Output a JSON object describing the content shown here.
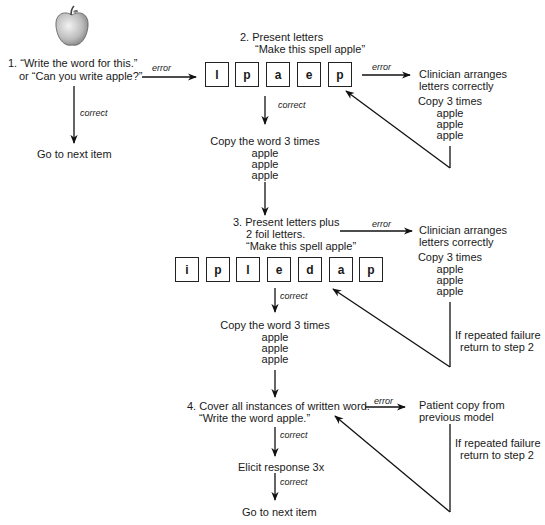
{
  "step1": {
    "line1": "1. “Write the word for this.”",
    "line2": "or “Can you write apple?”",
    "error_label": "error",
    "correct_label": "correct",
    "next": "Go to next item"
  },
  "step2": {
    "line1": "2. Present letters",
    "line2": "“Make this spell apple”",
    "letters": [
      "l",
      "p",
      "a",
      "e",
      "p"
    ],
    "error_label": "error",
    "correct_label": "correct",
    "error_action": {
      "line1": "Clinician arranges",
      "line2": "letters correctly"
    },
    "error_copy": {
      "title": "Copy 3 times",
      "words": [
        "apple",
        "apple",
        "apple"
      ]
    },
    "correct_copy": {
      "title": "Copy the word 3 times",
      "words": [
        "apple",
        "apple",
        "apple"
      ]
    }
  },
  "step3": {
    "line1": "3. Present letters plus",
    "line2": "2 foil letters.",
    "line3": "“Make this spell apple”",
    "letters": [
      "i",
      "p",
      "l",
      "e",
      "d",
      "a",
      "p"
    ],
    "error_label": "error",
    "correct_label": "correct",
    "error_action": {
      "line1": "Clinician arranges",
      "line2": "letters correctly"
    },
    "error_copy": {
      "title": "Copy 3 times",
      "words": [
        "apple",
        "apple",
        "apple"
      ]
    },
    "failure": {
      "line1": "If repeated failure",
      "line2": "return to step 2"
    },
    "correct_copy": {
      "title": "Copy the word 3 times",
      "words": [
        "apple",
        "apple",
        "apple"
      ]
    }
  },
  "step4": {
    "line1": "4. Cover all instances of written word.",
    "line2": "“Write the word apple.”",
    "error_label": "error",
    "correct_label": "correct",
    "error_action": {
      "line1": "Patient copy from",
      "line2": "previous model"
    },
    "failure": {
      "line1": "If repeated failure",
      "line2": "return to step 2"
    },
    "elicit": "Elicit response 3x",
    "correct_label2": "correct",
    "next": "Go to next item"
  },
  "picture": {
    "icon": "apple-icon"
  }
}
